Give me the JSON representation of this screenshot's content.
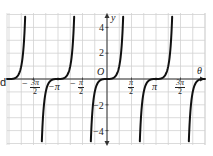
{
  "chart_data": {
    "type": "line",
    "title": "",
    "xlabel": "θ",
    "ylabel": "y",
    "origin_label": "O",
    "xlim": [
      -5.0,
      3.3
    ],
    "ylim": [
      -5.2,
      5.2
    ],
    "grid": true,
    "x_ticks": [
      {
        "value": -4.712,
        "label_num": "3π",
        "label_den": "2",
        "negative": true
      },
      {
        "value": -3.1416,
        "label": "−π"
      },
      {
        "value": -1.5708,
        "label_num": "π",
        "label_den": "2",
        "negative": true
      },
      {
        "value": 1.5708,
        "label_num": "π",
        "label_den": "2",
        "negative": false
      },
      {
        "value": 3.1416,
        "label": "π"
      },
      {
        "value": 4.712,
        "label_num": "3π",
        "label_den": "2",
        "negative": false
      }
    ],
    "y_ticks": [
      {
        "value": 4,
        "label": "4"
      },
      {
        "value": 2,
        "label": "2"
      },
      {
        "value": -2,
        "label": "−2"
      },
      {
        "value": -4,
        "label": "−4"
      }
    ],
    "series": [
      {
        "name": "y = tan³θ",
        "description": "Periodic curve with period π, zeros at θ = kπ (flat inflection), vertical asymptotes at θ = π/2 + kπ",
        "color": "#111111",
        "zeros": [
          -6.2832,
          -3.1416,
          0,
          3.1416,
          6.2832
        ],
        "asymptotes": [
          -4.712,
          -1.5708,
          1.5708,
          4.712
        ]
      }
    ],
    "side_text": "d",
    "colors": {
      "grid": "#cfcfcf",
      "axis": "#333333",
      "curve": "#111111"
    }
  }
}
